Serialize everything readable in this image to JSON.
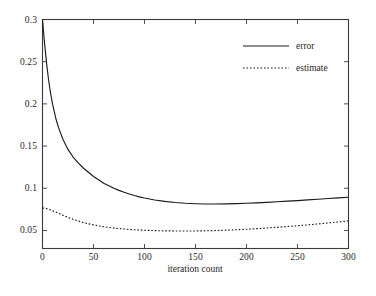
{
  "chart_data": {
    "type": "line",
    "title": "",
    "xlabel": "iteration count",
    "ylabel": "",
    "xlim": [
      0,
      300
    ],
    "ylim": [
      0.0286,
      0.3
    ],
    "grid": false,
    "legend_position": "top-right-inside",
    "xticks": [
      0,
      50,
      100,
      150,
      200,
      250,
      300
    ],
    "xtick_labels": [
      "0",
      "50",
      "100",
      "150",
      "200",
      "250",
      "300"
    ],
    "yticks": [
      0.05,
      0.1,
      0.15,
      0.2,
      0.25,
      0.3
    ],
    "ytick_labels": [
      "0.05",
      "0.1",
      "0.15",
      "0.2",
      "0.25",
      "0.3"
    ],
    "series": [
      {
        "name": "error",
        "style": "solid",
        "color": "#1a1a1a",
        "x": [
          0,
          2,
          4,
          6,
          8,
          10,
          13,
          16,
          20,
          25,
          30,
          35,
          40,
          45,
          50,
          55,
          60,
          65,
          70,
          75,
          80,
          85,
          90,
          95,
          100,
          110,
          120,
          130,
          140,
          150,
          160,
          170,
          180,
          190,
          200,
          210,
          220,
          230,
          240,
          250,
          260,
          270,
          280,
          290,
          300
        ],
        "y": [
          0.3,
          0.272,
          0.248,
          0.228,
          0.212,
          0.199,
          0.183,
          0.171,
          0.158,
          0.146,
          0.137,
          0.13,
          0.124,
          0.119,
          0.114,
          0.11,
          0.106,
          0.103,
          0.1,
          0.0975,
          0.0952,
          0.0932,
          0.0914,
          0.0898,
          0.0884,
          0.0861,
          0.0844,
          0.0831,
          0.0822,
          0.0817,
          0.0814,
          0.0814,
          0.0815,
          0.0818,
          0.0822,
          0.0827,
          0.0833,
          0.084,
          0.0847,
          0.0854,
          0.0862,
          0.087,
          0.0878,
          0.0886,
          0.0894
        ]
      },
      {
        "name": "estimate",
        "style": "dotted",
        "color": "#1a1a1a",
        "x": [
          0,
          2,
          4,
          6,
          8,
          10,
          13,
          16,
          20,
          25,
          30,
          35,
          40,
          45,
          50,
          55,
          60,
          65,
          70,
          75,
          80,
          85,
          90,
          95,
          100,
          110,
          120,
          130,
          140,
          150,
          160,
          170,
          180,
          190,
          200,
          210,
          220,
          230,
          240,
          250,
          260,
          270,
          280,
          290,
          300
        ],
        "y": [
          0.0765,
          0.0764,
          0.0758,
          0.075,
          0.0742,
          0.0733,
          0.0718,
          0.0702,
          0.0681,
          0.0655,
          0.0632,
          0.0612,
          0.0594,
          0.0579,
          0.0566,
          0.0554,
          0.0544,
          0.0536,
          0.0528,
          0.0522,
          0.0517,
          0.0512,
          0.0508,
          0.0505,
          0.0502,
          0.0498,
          0.0495,
          0.0494,
          0.0493,
          0.0494,
          0.0496,
          0.0499,
          0.0503,
          0.0508,
          0.0514,
          0.0521,
          0.0529,
          0.0537,
          0.0546,
          0.0556,
          0.0566,
          0.0577,
          0.0589,
          0.0601,
          0.0614
        ]
      }
    ],
    "legend": [
      {
        "label": "error",
        "style": "solid"
      },
      {
        "label": "estimate",
        "style": "dotted"
      }
    ],
    "axis_color": "#3a3a3a"
  }
}
